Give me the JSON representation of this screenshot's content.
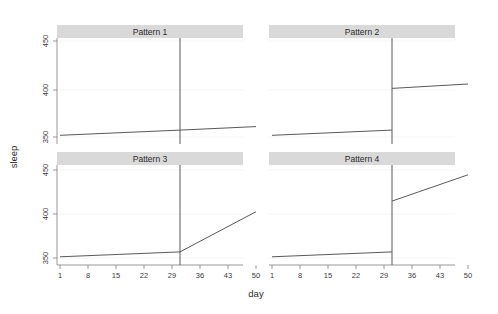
{
  "chart_data": {
    "type": "line",
    "title": "",
    "xlabel": "day",
    "ylabel": "sleep",
    "xlim": [
      1,
      50
    ],
    "ylim": [
      340,
      462
    ],
    "grid": true,
    "legend": null,
    "x_ticks": [
      1,
      8,
      15,
      22,
      29,
      36,
      43,
      50
    ],
    "x_tick_labels": [
      "1",
      "8",
      "15",
      "22",
      "29",
      "36",
      "43",
      "50"
    ],
    "y_ticks": [
      350,
      400,
      450
    ],
    "y_tick_labels": [
      "350",
      "400",
      "450"
    ],
    "intervention_day": 31,
    "layout": "2x2 trellis panels, strip labels on top",
    "panels": [
      {
        "label": "Pattern 1",
        "description": "no level change, no slope change",
        "segments": [
          {
            "name": "pre",
            "x": [
              1,
              31
            ],
            "y": [
              350,
              356
            ]
          },
          {
            "name": "post",
            "x": [
              31,
              50
            ],
            "y": [
              356,
              360
            ]
          }
        ],
        "vline_x": 31
      },
      {
        "label": "Pattern 2",
        "description": "level change only",
        "segments": [
          {
            "name": "pre",
            "x": [
              1,
              31
            ],
            "y": [
              350,
              356
            ]
          },
          {
            "name": "post",
            "x": [
              31,
              50
            ],
            "y": [
              404,
              409
            ]
          }
        ],
        "vline_x": 31
      },
      {
        "label": "Pattern 3",
        "description": "slope change only",
        "segments": [
          {
            "name": "pre",
            "x": [
              1,
              31
            ],
            "y": [
              350,
              356
            ]
          },
          {
            "name": "post",
            "x": [
              31,
              50
            ],
            "y": [
              356,
              405
            ]
          }
        ],
        "vline_x": 31
      },
      {
        "label": "Pattern 4",
        "description": "level change and slope change",
        "segments": [
          {
            "name": "pre",
            "x": [
              1,
              31
            ],
            "y": [
              350,
              356
            ]
          },
          {
            "name": "post",
            "x": [
              31,
              50
            ],
            "y": [
              418,
              450
            ]
          }
        ],
        "vline_x": 31
      }
    ],
    "colors": {
      "line": "#595959",
      "strip_background": "#d9d9d9",
      "panel_border": "#8c8c8c",
      "grid": "#f0f0f0",
      "text": "#2b2b2b",
      "background": "#ffffff"
    }
  }
}
